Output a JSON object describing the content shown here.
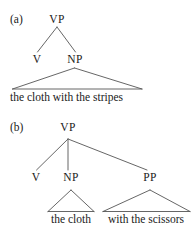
{
  "figure": {
    "background_color": "#ffffff",
    "line_color": "#555555",
    "text_color": "#1a1a1a",
    "kind": "syntax-tree-diagram",
    "panels": [
      {
        "id": "a",
        "label": "(a)",
        "root": "VP",
        "nodes": [
          "V",
          "NP"
        ],
        "terminal": "the cloth with the stripes"
      },
      {
        "id": "b",
        "label": "(b)",
        "root": "VP",
        "nodes": [
          "V",
          "NP",
          "PP"
        ],
        "terminals": [
          "the cloth",
          "with the scissors"
        ]
      }
    ]
  }
}
